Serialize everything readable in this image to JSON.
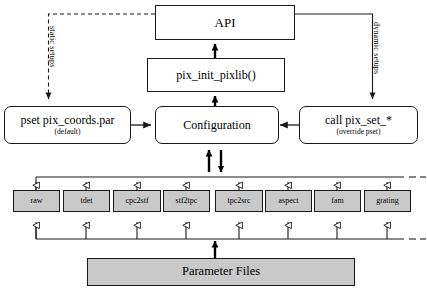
{
  "diagram": {
    "colors": {
      "stroke": "#1a1a1a",
      "box_fill_gray": "#c9c9c9",
      "box_fill_white": "#ffffff",
      "background": "#ffffff"
    },
    "nodes": {
      "api": {
        "label": "API"
      },
      "pix_init": {
        "label": "pix_init_pixlib()"
      },
      "configuration": {
        "label": "Configuration"
      },
      "pset": {
        "label": "pset pix_coords.par",
        "sub": "(default)"
      },
      "call_pix_set": {
        "label": "call pix_set_*",
        "sub": "(override pset)"
      },
      "parameter_files": {
        "label": "Parameter Files"
      }
    },
    "edge_labels": {
      "static": "static setups",
      "dynamic": "dynamic setups"
    },
    "modules": [
      {
        "label": "raw"
      },
      {
        "label": "tdet"
      },
      {
        "label": "cpc2stf"
      },
      {
        "label": "stf2tpc"
      },
      {
        "label": "tpc2src"
      },
      {
        "label": "aspect"
      },
      {
        "label": "fam"
      },
      {
        "label": "grating"
      }
    ]
  }
}
